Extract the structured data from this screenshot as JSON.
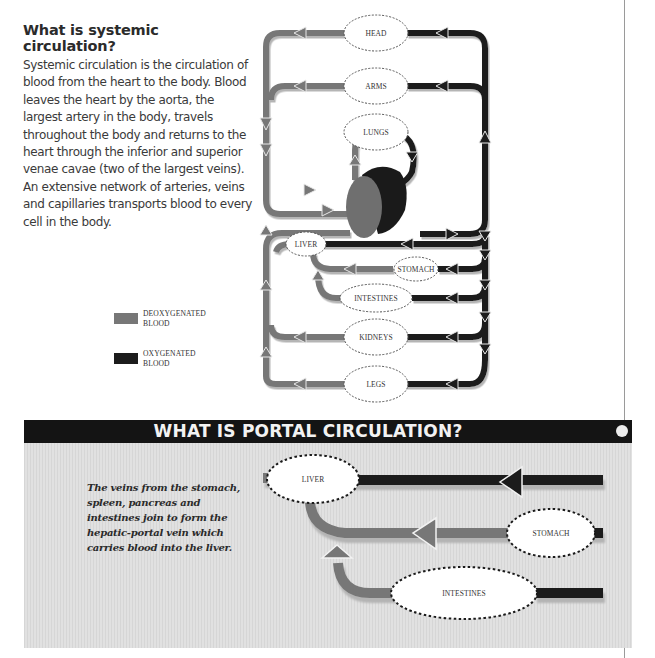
{
  "systemic": {
    "title": "What is systemic circulation?",
    "body": "Systemic circulation is the circulation of blood from the heart to the body. Blood leaves the heart by the aorta, the largest artery in the body, travels throughout the body and returns to the heart through the inferior and superior venae cavae (two of the largest veins). An extensive network of arteries, veins and capillaries transports blood to every cell in the body."
  },
  "systemic_diagram": {
    "organs": {
      "head": "HEAD",
      "arms": "ARMS",
      "lungs": "LUNGS",
      "liver": "LIVER",
      "stomach": "STOMACH",
      "intestines": "INTESTINES",
      "kidneys": "KIDNEYS",
      "legs": "LEGS"
    },
    "center_icon": "heart-icon"
  },
  "legend": {
    "items": [
      {
        "label": "DEOXYGENATED BLOOD",
        "color": "#777777"
      },
      {
        "label": "OXYGENATED BLOOD",
        "color": "#1c1c1c"
      }
    ]
  },
  "portal": {
    "title": "WHAT IS PORTAL CIRCULATION?",
    "body": "The veins from the stomach, spleen, pancreas and intestines join to form the hepatic-portal vein which carries blood into the liver.",
    "organs": {
      "liver": "LIVER",
      "stomach": "STOMACH",
      "intestines": "INTESTINES"
    }
  },
  "colors": {
    "deoxygenated": "#777777",
    "oxygenated": "#1c1c1c",
    "portal_background": "#dcdcdc",
    "header_bar": "#141414"
  }
}
